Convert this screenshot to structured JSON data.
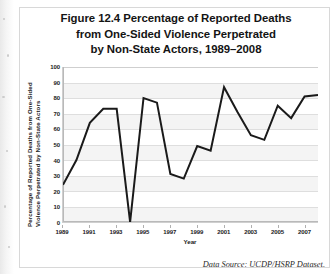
{
  "figure": {
    "title_lines": [
      "Figure 12.4 Percentage of Reported Deaths",
      "from One-Sided Violence Perpetrated",
      "by Non-State Actors, 1989–2008"
    ],
    "source_note": "Data Source: UCDP/HSRP Dataset."
  },
  "chart_data": {
    "type": "line",
    "title": "Figure 12.4 Percentage of Reported Deaths from One-Sided Violence Perpetrated by Non-State Actors, 1989–2008",
    "xlabel": "Year",
    "ylabel_lines": [
      "Percentage of Reported Deaths from One-Sided",
      "Violence Perpetrated by Non-State Actors"
    ],
    "ylabel": "Percentage of Reported Deaths from One-Sided Violence Perpetrated by Non-State Actors",
    "x": [
      1989,
      1990,
      1991,
      1992,
      1993,
      1994,
      1995,
      1996,
      1997,
      1998,
      1999,
      2000,
      2001,
      2002,
      2003,
      2004,
      2005,
      2006,
      2007,
      2008
    ],
    "values": [
      24,
      40,
      64,
      73,
      73,
      0,
      80,
      77,
      31,
      28,
      49,
      46,
      87,
      71,
      56,
      53,
      75,
      67,
      81,
      82
    ],
    "ylim": [
      0,
      100
    ],
    "yticks": [
      100,
      90,
      80,
      70,
      60,
      50,
      40,
      30,
      20,
      10,
      0
    ],
    "xlim": [
      1989,
      2008
    ],
    "xticks": [
      1989,
      1991,
      1993,
      1995,
      1997,
      1999,
      2001,
      2003,
      2005,
      2007
    ],
    "xticklabels": [
      "1989",
      "1991",
      "1993",
      "1995",
      "1997",
      "1999",
      "2001",
      "2003",
      "2005",
      "2007"
    ],
    "grid": "horizontal",
    "legend": "none",
    "series_color": "#1a1a1a",
    "line_width": 2
  }
}
